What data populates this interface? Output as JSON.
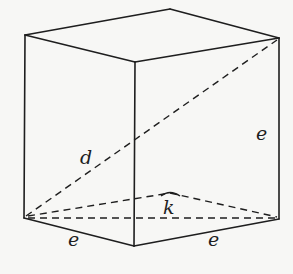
{
  "diagram": {
    "type": "cube-wireframe",
    "colors": {
      "background": "#f7f7f5",
      "stroke": "#1e1e1e"
    },
    "labels": {
      "d": "d",
      "k": "k",
      "e_right": "e",
      "e_bottom_left": "e",
      "e_bottom_right": "e"
    },
    "vertices": {
      "top_back": [
        170,
        9
      ],
      "top_left": [
        25,
        35
      ],
      "top_right": [
        279,
        38
      ],
      "top_front": [
        135,
        62
      ],
      "bottom_left": [
        24,
        218
      ],
      "bottom_front": [
        134,
        246
      ],
      "bottom_right": [
        279,
        219
      ],
      "bottom_back_hidden": [
        170,
        193
      ]
    },
    "solid_edges": [
      [
        "top_left",
        "top_back"
      ],
      [
        "top_back",
        "top_right"
      ],
      [
        "top_left",
        "top_front"
      ],
      [
        "top_front",
        "top_right"
      ],
      [
        "top_left",
        "bottom_left"
      ],
      [
        "top_front",
        "bottom_front"
      ],
      [
        "top_right",
        "bottom_right"
      ],
      [
        "bottom_left",
        "bottom_front"
      ],
      [
        "bottom_front",
        "bottom_right"
      ]
    ],
    "dashed_lines": [
      [
        "bottom_left",
        "top_right"
      ],
      [
        "bottom_left",
        "bottom_right"
      ],
      [
        "bottom_left",
        "bottom_back_hidden"
      ],
      [
        "bottom_back_hidden",
        "bottom_right"
      ]
    ]
  }
}
